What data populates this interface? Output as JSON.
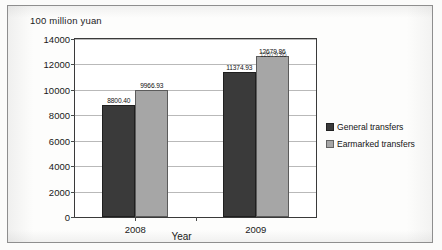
{
  "figure": {
    "unit_caption": "100 million yuan",
    "background_color": "#ffffff",
    "frame_color": "#8e8e8e"
  },
  "legend": {
    "position": "right",
    "entries": [
      {
        "label": "General transfers",
        "color": "#3a3a3a",
        "icon": "legend-swatch"
      },
      {
        "label": "Earmarked transfers",
        "color": "#a6a6a6",
        "icon": "legend-swatch"
      }
    ]
  },
  "axes": {
    "x_title": "Year",
    "y_ticks": [
      "14000",
      "12000",
      "10000",
      "8000",
      "6000",
      "4000",
      "2000",
      "0"
    ],
    "x_ticks": [
      "2008",
      "2009"
    ]
  },
  "chart_data": {
    "type": "bar",
    "title": "",
    "subtitle": "",
    "xlabel": "Year",
    "ylabel": "100 million yuan",
    "categories": [
      "2008",
      "2009"
    ],
    "series": [
      {
        "name": "General transfers",
        "color": "#3a3a3a",
        "values": [
          8800.4,
          11374.93
        ]
      },
      {
        "name": "Earmarked transfers",
        "color": "#a6a6a6",
        "values": [
          9966.93,
          12679.86
        ]
      }
    ],
    "data_labels": [
      [
        "8800.40",
        "11374.93"
      ],
      [
        "9966.93",
        "12679.86"
      ]
    ],
    "ylim": [
      0,
      14000
    ],
    "ytick_step": 2000,
    "grid": true,
    "legend_position": "right"
  }
}
